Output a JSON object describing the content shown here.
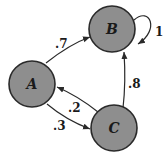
{
  "diagram": {
    "type": "markov-chain",
    "nodes": [
      {
        "id": "A",
        "label": "A"
      },
      {
        "id": "B",
        "label": "B"
      },
      {
        "id": "C",
        "label": "C"
      }
    ],
    "edges": [
      {
        "from": "A",
        "to": "B",
        "label": ".7"
      },
      {
        "from": "B",
        "to": "B",
        "label": "1"
      },
      {
        "from": "C",
        "to": "B",
        "label": ".8"
      },
      {
        "from": "C",
        "to": "A",
        "label": ".2"
      },
      {
        "from": "A",
        "to": "C",
        "label": ".3"
      }
    ],
    "colors": {
      "node_fill": "#8e8e8e",
      "stroke": "#2a2a2a"
    }
  }
}
